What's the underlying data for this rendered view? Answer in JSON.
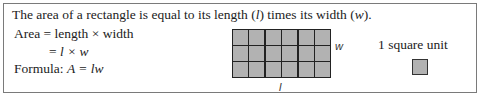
{
  "intro": {
    "text_before": "The area of a rectangle is equal to its length (",
    "l_symbol": "l",
    "text_middle": ") times its width (",
    "w_symbol": "w",
    "text_after": ")."
  },
  "formula_lines": {
    "line1": "Area = length × width",
    "line2_prefix": "= ",
    "line2_expr": "l × w",
    "line3_prefix": "Formula: ",
    "line3_expr": "A = lw"
  },
  "diagram": {
    "columns": 6,
    "rows": 3,
    "width_label": "w",
    "length_label": "l",
    "fill_color": "#b2b2b2",
    "line_color": "#222222"
  },
  "unit": {
    "label": "1 square unit"
  }
}
